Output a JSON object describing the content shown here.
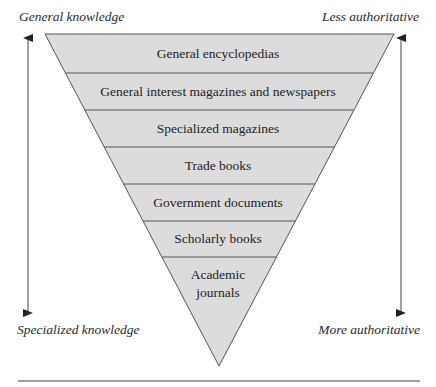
{
  "diagram": {
    "type": "inverted-pyramid",
    "left_axis": {
      "top_label": "General knowledge",
      "bottom_label": "Specialized knowledge"
    },
    "right_axis": {
      "top_label": "Less authoritative",
      "bottom_label": "More authoritative"
    },
    "tiers": [
      {
        "label": "General encyclopedias"
      },
      {
        "label": "General interest magazines and newspapers"
      },
      {
        "label": "Specialized magazines"
      },
      {
        "label": "Trade books"
      },
      {
        "label": "Government documents"
      },
      {
        "label": "Scholarly books"
      },
      {
        "label": "Academic",
        "label2": "journals"
      }
    ],
    "colors": {
      "fill": "#dcdcdc",
      "stroke": "#555555",
      "text": "#222222"
    }
  }
}
